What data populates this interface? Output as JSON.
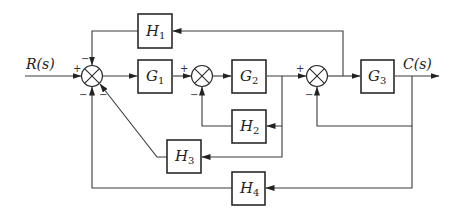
{
  "diagram": {
    "type": "control-system-block-diagram",
    "input": {
      "label": "R(s)"
    },
    "output": {
      "label": "C(s)"
    },
    "blocks": [
      {
        "id": "G1",
        "letter": "G",
        "sub": "1"
      },
      {
        "id": "G2",
        "letter": "G",
        "sub": "2"
      },
      {
        "id": "G3",
        "letter": "G",
        "sub": "3"
      },
      {
        "id": "H1",
        "letter": "H",
        "sub": "1"
      },
      {
        "id": "H2",
        "letter": "H",
        "sub": "2"
      },
      {
        "id": "H3",
        "letter": "H",
        "sub": "3"
      },
      {
        "id": "H4",
        "letter": "H",
        "sub": "4"
      }
    ],
    "summing_junctions": [
      {
        "id": "S1",
        "signs": {
          "left": "+",
          "top": "−",
          "bottom_left": "−",
          "bottom_right": "−"
        }
      },
      {
        "id": "S2",
        "signs": {
          "left": "+",
          "bottom": "−"
        }
      },
      {
        "id": "S3",
        "signs": {
          "left": "+",
          "bottom": "−"
        }
      }
    ],
    "connections": [
      "R(s) → S1 (+)",
      "S1 → G1 → S2 (+)",
      "S2 → G2 → S3 (+)",
      "S3 → G3 → C(s)",
      "S3 output → H1 → S1 (−, top)",
      "G2 output → H2 → S2 (−, bottom)",
      "G2 output → H3 → S1 (−, bottom-right)",
      "C(s) → S3 (−, bottom)",
      "C(s) → H4 → S1 (−, bottom)"
    ]
  }
}
